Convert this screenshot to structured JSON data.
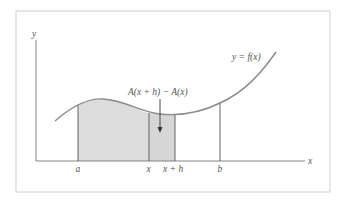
{
  "figure": {
    "frame": {
      "x": 16,
      "y": 11,
      "width": 314,
      "height": 181,
      "stroke": "#d0d0d0"
    },
    "axes": {
      "origin": {
        "x": 36,
        "y": 161
      },
      "x_axis_end": 305,
      "y_axis_top": 40,
      "color": "#777777",
      "x_label": "x",
      "y_label": "y"
    },
    "curve": {
      "label": "y = f(x)",
      "color": "#8a8a8a",
      "path": "M55,121 C70,108 88,98 103,99 C125,100 140,112 160,114 C180,116 200,113 220,103 C245,92 262,72 276,52"
    },
    "shading": {
      "fill": "#dcdcdc",
      "accumulated_region": {
        "from": "a",
        "to": "x"
      },
      "strip_region": {
        "from": "x",
        "to": "x + h"
      }
    },
    "verticals": [
      {
        "name": "a",
        "x": 78,
        "top_y": 105,
        "label": "a"
      },
      {
        "name": "x",
        "x": 149,
        "top_y": 113,
        "label": "x"
      },
      {
        "name": "x+h",
        "x": 175,
        "top_y": 115,
        "label": "x + h"
      },
      {
        "name": "b",
        "x": 220,
        "top_y": 103,
        "label": "b"
      }
    ],
    "annotation": {
      "text": "A(x + h) − A(x)",
      "arrow": {
        "x": 160,
        "y_start": 99,
        "y_end": 132
      }
    }
  }
}
